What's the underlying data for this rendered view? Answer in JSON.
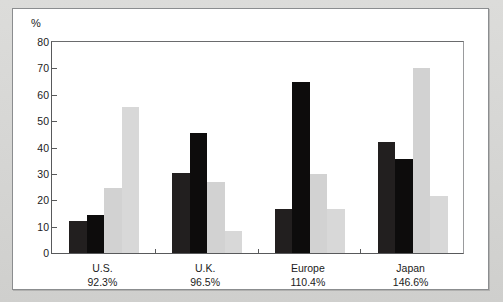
{
  "chart_data": {
    "type": "bar",
    "title": "",
    "xlabel": "",
    "ylabel": "%",
    "unit_label": "%",
    "ylim": [
      0,
      80
    ],
    "ytick_labels": [
      "0",
      "10",
      "20",
      "30",
      "40",
      "50",
      "60",
      "70",
      "80"
    ],
    "ytick_values": [
      0,
      10,
      20,
      30,
      40,
      50,
      60,
      70,
      80
    ],
    "grid": false,
    "legend_position": "inside-top-left",
    "categories": [
      "U.S.",
      "U.K.",
      "Europe",
      "Japan"
    ],
    "category_sublabels": [
      "92.3%",
      "96.5%",
      "110.4%",
      "146.6%"
    ],
    "series": [
      {
        "name": "Banks",
        "color": "#221f1f",
        "values": [
          12.0,
          30.5,
          16.5,
          42.0
        ]
      },
      {
        "name": "Equity",
        "color": "#0d0c0c",
        "values": [
          14.5,
          45.5,
          65.0,
          35.5
        ]
      },
      {
        "name": "Loans and trade credits",
        "color": "#d2d2d2",
        "values": [
          24.5,
          27.0,
          30.0,
          70.0
        ]
      },
      {
        "name": "Other",
        "color": "#d8d8d8",
        "values": [
          55.5,
          8.5,
          16.5,
          21.5
        ]
      }
    ]
  },
  "legend": {
    "items": [
      {
        "label": "Banks"
      },
      {
        "label": "Equity"
      },
      {
        "label": "Loans and trade credits"
      },
      {
        "label": "Other"
      }
    ]
  },
  "axis": {
    "unit": "%"
  }
}
